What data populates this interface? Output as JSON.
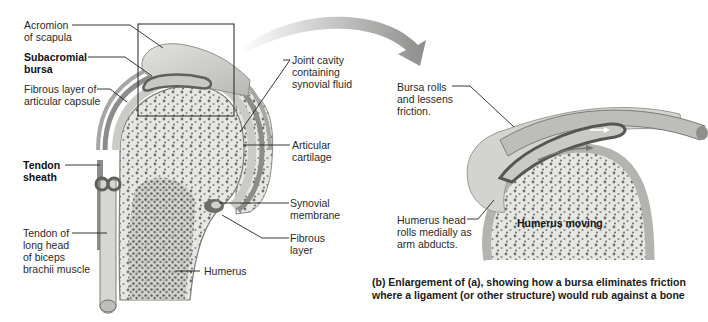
{
  "figure": {
    "panel_a_labels": {
      "acromion": "Acromion\nof scapula",
      "subacromial_bursa": "Subacromial\nbursa",
      "fibrous_layer_capsule": "Fibrous layer of\narticular capsule",
      "tendon_sheath": "Tendon\nsheath",
      "tendon_biceps": "Tendon of\nlong head\nof biceps\nbrachii muscle",
      "joint_cavity": "Joint cavity\ncontaining\nsynovial fluid",
      "articular_cartilage": "Articular\ncartilage",
      "synovial_membrane": "Synovial\nmembrane",
      "fibrous_layer": "Fibrous\nlayer",
      "humerus": "Humerus"
    },
    "panel_b_labels": {
      "bursa_rolls": "Bursa rolls\nand lessens\nfriction.",
      "humerus_head": "Humerus head\nrolls medially as\narm abducts.",
      "humerus_moving": "Humerus moving"
    },
    "caption": "(b) Enlargement of (a), showing how a bursa eliminates friction\n     where a ligament (or other structure) would rub against a bone",
    "colors": {
      "bone": "#e9e9e6",
      "bone_spongy": "#7a7a78",
      "cartilage": "#d6d6d3",
      "bursa": "#6e6e6c",
      "arrow": "#9a9a98",
      "leader_line": "#222222"
    }
  }
}
